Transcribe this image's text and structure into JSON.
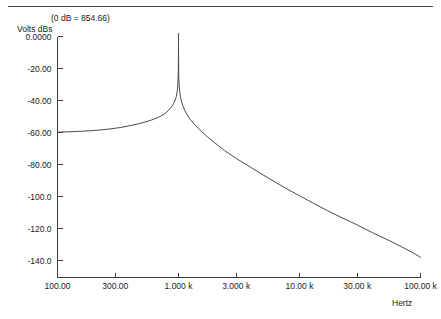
{
  "annotation": {
    "db_reference": "(0 dB = 854.66)"
  },
  "axis_titles": {
    "y": "Volts dBs",
    "x": "Hertz"
  },
  "chart_data": {
    "type": "line",
    "title": "",
    "subtitle": "(0 dB = 854.66)",
    "xlabel": "Hertz",
    "ylabel": "Volts dBs",
    "xscale": "log",
    "yscale": "linear",
    "grid": false,
    "legend": false,
    "xlim": [
      100,
      100000
    ],
    "ylim": [
      -150,
      5
    ],
    "xticks": [
      100,
      300,
      1000,
      3000,
      10000,
      30000,
      100000
    ],
    "xticklabels": [
      "100.00",
      "300.00",
      "1.000 k",
      "3.000 k",
      "10.00 k",
      "30.00 k",
      "100.00 k"
    ],
    "yticks": [
      0,
      -20,
      -40,
      -60,
      -80,
      -100,
      -120,
      -140
    ],
    "yticklabels": [
      "0.0000",
      "-20.00",
      "-40.00",
      "-60.00",
      "-80.00",
      "-100.0",
      "-120.0",
      "-140.0"
    ],
    "series": [
      {
        "name": "Volts dBs",
        "color": "#4a4a4a",
        "description": "Sharp high-Q resonance peak at 1 kHz; flat -60 dB floor below resonance, -20 dB/decade roll-off above",
        "x": [
          100,
          120,
          150,
          180,
          220,
          270,
          330,
          400,
          470,
          550,
          620,
          700,
          760,
          820,
          870,
          910,
          940,
          960,
          975,
          985,
          992,
          996,
          999,
          1000,
          1001,
          1004,
          1008,
          1015,
          1025,
          1040,
          1060,
          1090,
          1130,
          1180,
          1250,
          1350,
          1500,
          1700,
          2000,
          2400,
          3000,
          4000,
          5000,
          6500,
          8000,
          10000,
          13000,
          17000,
          22000,
          30000,
          40000,
          55000,
          70000,
          85000,
          100000
        ],
        "y": [
          -59.8,
          -59.6,
          -59.3,
          -59.0,
          -58.5,
          -57.8,
          -56.9,
          -55.7,
          -54.5,
          -53.1,
          -51.8,
          -50.1,
          -48.5,
          -46.5,
          -44.3,
          -42.0,
          -39.6,
          -37.5,
          -34.5,
          -31.0,
          -26.5,
          -21.5,
          -12.0,
          2.0,
          -12.0,
          -22.0,
          -27.0,
          -31.5,
          -35.0,
          -38.2,
          -40.8,
          -43.6,
          -46.3,
          -49.0,
          -51.8,
          -54.8,
          -58.3,
          -62.2,
          -66.5,
          -71.3,
          -76.2,
          -82.0,
          -86.5,
          -91.6,
          -95.6,
          -99.5,
          -104.2,
          -108.8,
          -113.0,
          -117.8,
          -122.6,
          -127.5,
          -131.5,
          -134.8,
          -138.0
        ]
      }
    ]
  }
}
